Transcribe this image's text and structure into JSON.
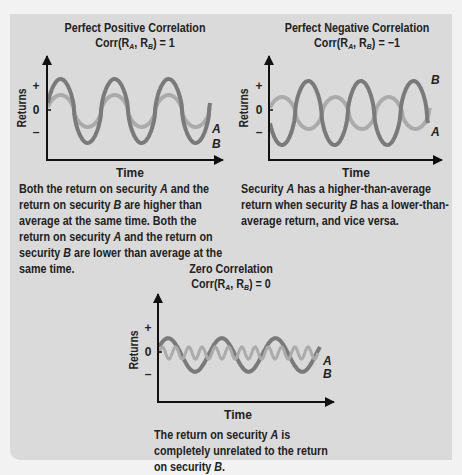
{
  "colors": {
    "background_outer": "#f2f2f2",
    "panel": "#dadada",
    "series_A": "#ababab",
    "series_B": "#7a7a7a",
    "axis": "#111111",
    "text": "#222222"
  },
  "charts": [
    {
      "title": "Perfect Positive Correlation",
      "formula_prefix": "Corr(R",
      "formula_sub_a": "A",
      "formula_mid": ", R",
      "formula_sub_b": "B",
      "formula_suffix": ") = 1",
      "xlabel": "Time",
      "ylabel": "Returns",
      "yticks": [
        "+",
        "0",
        "–"
      ],
      "series_labels": [
        "A",
        "B"
      ],
      "caption": "Both the return on security A and the return on security B are higher than average at the same time. Both the return on security A and the return on security B are lower than average at the same time."
    },
    {
      "title": "Perfect Negative Correlation",
      "formula_prefix": "Corr(R",
      "formula_sub_a": "A",
      "formula_mid": ", R",
      "formula_sub_b": "B",
      "formula_suffix": ") = −1",
      "xlabel": "Time",
      "ylabel": "Returns",
      "yticks": [
        "+",
        "0",
        "–"
      ],
      "series_labels": [
        "B",
        "A"
      ],
      "caption": "Security A has a higher-than-average return when security B has a lower-than-average return, and vice versa."
    },
    {
      "title": "Zero Correlation",
      "formula_prefix": "Corr(R",
      "formula_sub_a": "A",
      "formula_mid": ", R",
      "formula_sub_b": "B",
      "formula_suffix": ") = 0",
      "xlabel": "Time",
      "ylabel": "Returns",
      "yticks": [
        "+",
        "0",
        "–"
      ],
      "series_labels": [
        "A",
        "B"
      ],
      "caption": "The return on security A is completely unrelated to the return on security B."
    }
  ],
  "chart_data": [
    {
      "type": "line",
      "title": "Perfect Positive Correlation  Corr(R_A, R_B) = 1",
      "xlabel": "Time",
      "ylabel": "Returns",
      "yticks": [
        "+",
        "0",
        "–"
      ],
      "grid": false,
      "series": [
        {
          "name": "A",
          "shape": "sine",
          "amplitude": 0.5,
          "cycles": 3,
          "phase": "in-phase with B"
        },
        {
          "name": "B",
          "shape": "sine",
          "amplitude": 1.0,
          "cycles": 3,
          "phase": "in-phase with A"
        }
      ],
      "correlation": 1
    },
    {
      "type": "line",
      "title": "Perfect Negative Correlation  Corr(R_A, R_B) = −1",
      "xlabel": "Time",
      "ylabel": "Returns",
      "yticks": [
        "+",
        "0",
        "–"
      ],
      "grid": false,
      "series": [
        {
          "name": "A",
          "shape": "sine",
          "amplitude": 0.5,
          "cycles": 3,
          "phase": "opposite of B"
        },
        {
          "name": "B",
          "shape": "sine",
          "amplitude": 1.0,
          "cycles": 3,
          "phase": "opposite of A"
        }
      ],
      "correlation": -1
    },
    {
      "type": "line",
      "title": "Zero Correlation  Corr(R_A, R_B) = 0",
      "xlabel": "Time",
      "ylabel": "Returns",
      "yticks": [
        "+",
        "0",
        "–"
      ],
      "grid": false,
      "series": [
        {
          "name": "A",
          "shape": "sine",
          "amplitude": 0.25,
          "cycles": 12,
          "phase": "unrelated"
        },
        {
          "name": "B",
          "shape": "sine",
          "amplitude": 0.6,
          "cycles": 3,
          "phase": "unrelated"
        }
      ],
      "correlation": 0
    }
  ]
}
